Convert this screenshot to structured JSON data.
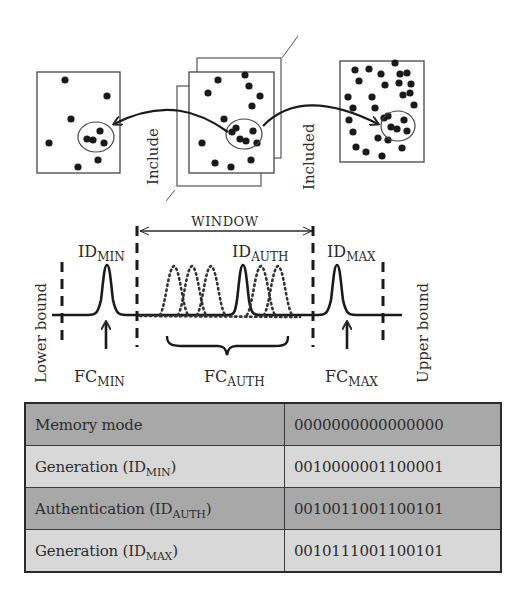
{
  "top_diagram": {
    "labels": {
      "include": "Include",
      "included": "Included"
    },
    "panels": [
      {
        "name": "left-population",
        "dots": 7,
        "cluster_dots": 5
      },
      {
        "name": "middle-population-stack",
        "dots": 13,
        "cluster_dots": 6,
        "stacked_layers": 3
      },
      {
        "name": "right-population",
        "dots": 34,
        "cluster_dots": 7
      }
    ]
  },
  "waveform": {
    "window_label": "WINDOW",
    "lower_bound_label": "Lower bound",
    "upper_bound_label": "Upper bound",
    "peaks": {
      "id_min": {
        "base": "ID",
        "sub": "MIN"
      },
      "id_auth": {
        "base": "ID",
        "sub": "AUTH"
      },
      "id_max": {
        "base": "ID",
        "sub": "MAX"
      }
    },
    "fc_labels": {
      "fc_min": {
        "base": "FC",
        "sub": "MIN"
      },
      "fc_auth": {
        "base": "FC",
        "sub": "AUTH"
      },
      "fc_max": {
        "base": "FC",
        "sub": "MAX"
      }
    }
  },
  "table": {
    "rows": [
      {
        "label": "Memory mode",
        "sub": "",
        "suffix": "",
        "value": "0000000000000000",
        "shade": "dark"
      },
      {
        "label": "Generation (ID",
        "sub": "MIN",
        "suffix": ")",
        "value": "0010000001100001",
        "shade": "light"
      },
      {
        "label": "Authentication (ID",
        "sub": "AUTH",
        "suffix": ")",
        "value": "0010011001100101",
        "shade": "dark"
      },
      {
        "label": "Generation (ID",
        "sub": "MAX",
        "suffix": ")",
        "value": "0010111001100101",
        "shade": "light"
      }
    ]
  },
  "colors": {
    "ink": "#2a2a2a",
    "row_dark": "#a8a8a8",
    "row_light": "#d8d8d8"
  }
}
